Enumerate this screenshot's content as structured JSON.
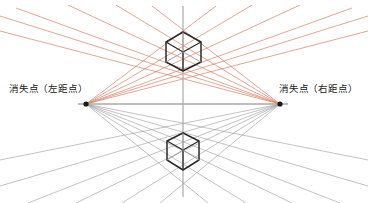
{
  "diagram": {
    "canvas": {
      "width": 368,
      "height": 203,
      "background": "#ffffff"
    },
    "labels": {
      "vanishing_point_left": "消失点（左距点）",
      "vanishing_point_right": "消失点（右距点）"
    },
    "colors": {
      "upper_rays": "#d98168",
      "lower_rays": "#9a9a9a",
      "axis": "#a9a9a9",
      "cube_stroke": "#2b2b2b",
      "cube_inner": "#8e8e8e",
      "vp_dot": "#1a1a1a",
      "label_text": "#1a1a1a"
    },
    "geometry": {
      "horizon_y": 104,
      "horizon_x1": 78,
      "horizon_x2": 288,
      "vertical_axis_x": 183,
      "vertical_axis_y1": 6,
      "vertical_axis_y2": 197,
      "vp_left": {
        "x": 86,
        "y": 104,
        "r": 2.6
      },
      "vp_right": {
        "x": 280,
        "y": 104,
        "r": 2.6
      }
    },
    "upper_rays": {
      "count": 12,
      "color": "#d98168",
      "from_left": [
        {
          "x2": 368,
          "y2": 16
        },
        {
          "x2": 368,
          "y2": 31
        },
        {
          "x2": 352,
          "y2": 8
        },
        {
          "x2": 300,
          "y2": 5
        },
        {
          "x2": 252,
          "y2": 5
        },
        {
          "x2": 216,
          "y2": 6
        }
      ],
      "from_right": [
        {
          "x2": 0,
          "y2": 16
        },
        {
          "x2": 0,
          "y2": 31
        },
        {
          "x2": 16,
          "y2": 8
        },
        {
          "x2": 68,
          "y2": 5
        },
        {
          "x2": 116,
          "y2": 5
        },
        {
          "x2": 152,
          "y2": 6
        }
      ]
    },
    "lower_rays": {
      "count": 12,
      "color": "#9a9a9a",
      "from_left": [
        {
          "x2": 368,
          "y2": 160
        },
        {
          "x2": 368,
          "y2": 186
        },
        {
          "x2": 340,
          "y2": 203
        },
        {
          "x2": 292,
          "y2": 203
        },
        {
          "x2": 246,
          "y2": 203
        },
        {
          "x2": 208,
          "y2": 203
        }
      ],
      "from_right": [
        {
          "x2": 0,
          "y2": 160
        },
        {
          "x2": 0,
          "y2": 186
        },
        {
          "x2": 28,
          "y2": 203
        },
        {
          "x2": 76,
          "y2": 203
        },
        {
          "x2": 122,
          "y2": 203
        },
        {
          "x2": 160,
          "y2": 203
        }
      ]
    },
    "upper_cube": {
      "name": "upper-cube",
      "top": {
        "x": 183,
        "y": 32
      },
      "left_top": {
        "x": 166,
        "y": 42
      },
      "right_top": {
        "x": 201,
        "y": 42
      },
      "center": {
        "x": 183,
        "y": 52
      },
      "left_bottom": {
        "x": 166,
        "y": 62
      },
      "right_bottom": {
        "x": 201,
        "y": 62
      },
      "bottom": {
        "x": 183,
        "y": 71
      }
    },
    "lower_cube": {
      "name": "lower-cube",
      "top": {
        "x": 183,
        "y": 133
      },
      "left_top": {
        "x": 167,
        "y": 141
      },
      "right_top": {
        "x": 199,
        "y": 141
      },
      "center": {
        "x": 183,
        "y": 150
      },
      "left_bottom": {
        "x": 167,
        "y": 160
      },
      "right_bottom": {
        "x": 199,
        "y": 160
      },
      "bottom": {
        "x": 183,
        "y": 170
      }
    }
  }
}
